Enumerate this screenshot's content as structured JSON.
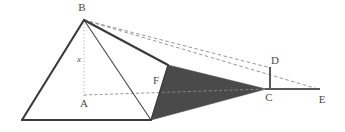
{
  "figure": {
    "background_color": "#ffffff",
    "width": 345,
    "height": 132,
    "labels": {
      "B": "B",
      "A": "A",
      "F": "F",
      "C": "C",
      "D": "D",
      "E": "E",
      "height": "x"
    },
    "colors": {
      "outline": "#3a3a3a",
      "shadow_fill": "#4a4a4a",
      "dashed_line": "#8a8a8a",
      "dotted_line": "#9a9a9a",
      "label_text": "#4a4a4a",
      "measure_text": "#555555"
    },
    "points": {
      "B": [
        84,
        20
      ],
      "A": [
        84,
        96
      ],
      "base_left": [
        22,
        120
      ],
      "base_mid": [
        151,
        120
      ],
      "F_corner": [
        168,
        65
      ],
      "C": [
        266,
        89
      ],
      "D": [
        271,
        68
      ],
      "E": [
        318,
        89
      ]
    },
    "label_positions": {
      "B": [
        82,
        11
      ],
      "A": [
        84,
        106
      ],
      "F": [
        156,
        83
      ],
      "C": [
        268,
        100
      ],
      "D": [
        274,
        64
      ],
      "E": [
        322,
        102
      ],
      "height": [
        79,
        61
      ]
    },
    "segments": [
      {
        "name": "edge-B-base-left",
        "from": "B",
        "to": "base_left",
        "style": "solid-thick"
      },
      {
        "name": "edge-base-left-base-mid",
        "from": "base_left",
        "to": "base_mid",
        "style": "solid-thick"
      },
      {
        "name": "edge-B-base-mid",
        "from": "B",
        "to": "base_mid",
        "style": "solid-thin"
      },
      {
        "name": "edge-B-F-corner",
        "from": "B",
        "to": "F_corner",
        "style": "solid-thick"
      },
      {
        "name": "edge-D-C",
        "from": "D",
        "to": "C",
        "style": "solid-thick"
      },
      {
        "name": "edge-C-E",
        "from": "C",
        "to": "E",
        "style": "solid-thick"
      },
      {
        "name": "ray-B-D",
        "from": "B",
        "to": "D",
        "style": "dashed"
      },
      {
        "name": "ray-B-E",
        "from": "B",
        "to": "E",
        "style": "dashed"
      },
      {
        "name": "altitude-B-A",
        "from": "B",
        "to": "A",
        "style": "dotted"
      },
      {
        "name": "baseline-A-C",
        "from": "A",
        "to": "C",
        "style": "dashed"
      }
    ],
    "shadow_polygon": {
      "name": "shadow-region",
      "vertices": [
        [
          168,
          65
        ],
        [
          266,
          89
        ],
        [
          151,
          120
        ]
      ],
      "fill": "#4a4a4a"
    }
  }
}
